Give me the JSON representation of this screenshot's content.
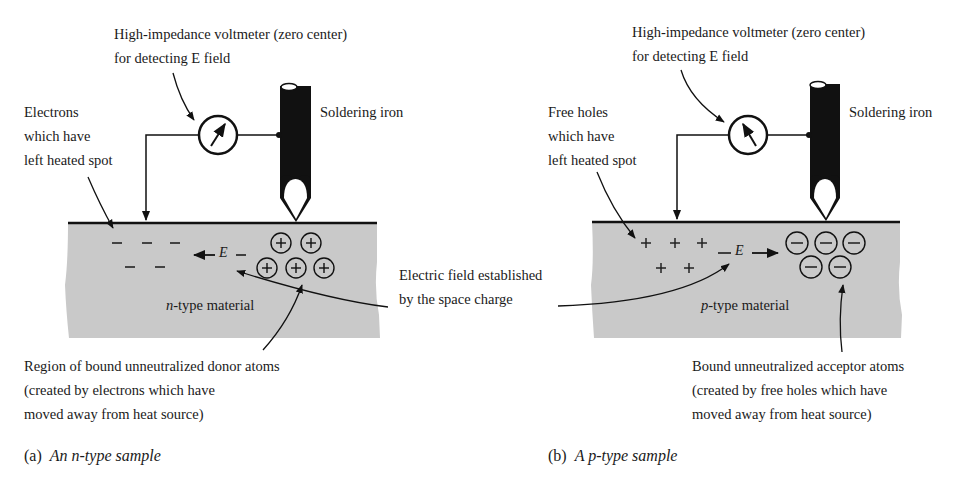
{
  "panel_a": {
    "voltmeter_label": {
      "line1": "High-impedance voltmeter (zero center)",
      "line2": "for detecting E field"
    },
    "iron_label": "Soldering iron",
    "carrier_label": {
      "line1": "Electrons",
      "line2": "which have",
      "line3": "left heated spot"
    },
    "material_label_prefix": "n",
    "material_label_suffix": "-type material",
    "free_charges": [
      "−",
      "−",
      "−",
      "−",
      "−"
    ],
    "bound_charges": [
      "+",
      "+",
      "+",
      "+",
      "+"
    ],
    "field_label": "E",
    "field_direction": "left",
    "bound_label": {
      "line1": "Region of bound unneutralized donor atoms",
      "line2": "(created by electrons which have",
      "line3": "moved away from heat source)"
    },
    "caption_letter": "(a)",
    "caption_text": "An n-type sample"
  },
  "panel_b": {
    "voltmeter_label": {
      "line1": "High-impedance voltmeter (zero center)",
      "line2": "for detecting E field"
    },
    "iron_label": "Soldering iron",
    "carrier_label": {
      "line1": "Free holes",
      "line2": "which have",
      "line3": "left heated spot"
    },
    "material_label_prefix": "p",
    "material_label_suffix": "-type material",
    "free_charges": [
      "+",
      "+",
      "+",
      "+",
      "+"
    ],
    "bound_charges": [
      "−",
      "−",
      "−",
      "−",
      "−"
    ],
    "field_label": "E",
    "field_direction": "right",
    "bound_label": {
      "line1": "Bound unneutralized acceptor atoms",
      "line2": "(created by free holes which have",
      "line3": "moved away from heat source)"
    },
    "caption_letter": "(b)",
    "caption_text": "A p-type sample"
  },
  "shared": {
    "field_annotation": {
      "line1": "Electric field established",
      "line2": "by the space charge"
    }
  },
  "colors": {
    "material_fill": "#c9c9c9",
    "ink": "#111111",
    "background": "#ffffff"
  }
}
